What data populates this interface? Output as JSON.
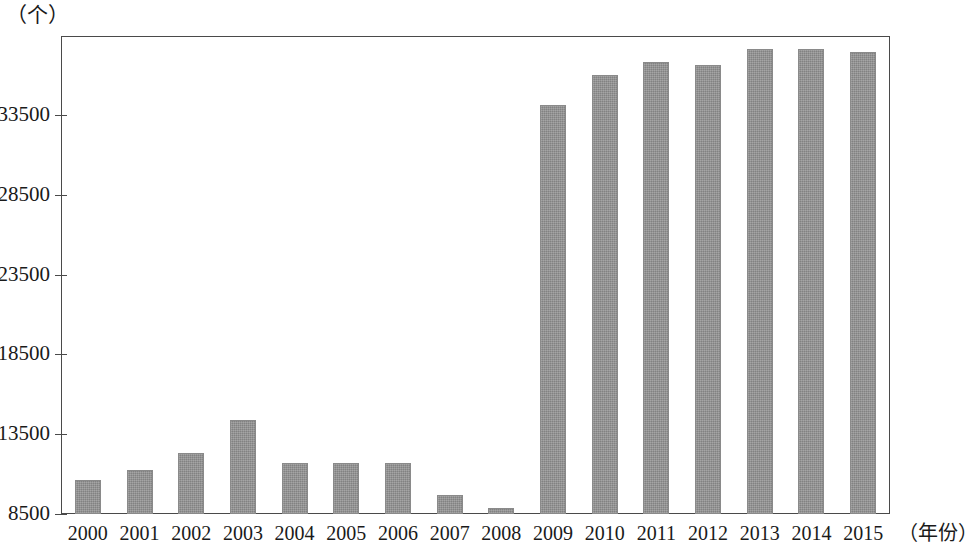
{
  "chart_data": {
    "type": "bar",
    "title": "",
    "subtitle": "",
    "xlabel": "（年份）",
    "ylabel": "（个）",
    "grid": false,
    "legend": null,
    "ylim": [
      8500,
      38375
    ],
    "yticks": [
      8500,
      13500,
      18500,
      23500,
      28500,
      33500
    ],
    "ytick_labels": [
      "8500",
      "13500",
      "18500",
      "23500",
      "28500",
      "33500"
    ],
    "categories": [
      "2000",
      "2001",
      "2002",
      "2003",
      "2004",
      "2005",
      "2006",
      "2007",
      "2008",
      "2009",
      "2010",
      "2011",
      "2012",
      "2013",
      "2014",
      "2015"
    ],
    "values": [
      10600,
      11250,
      12350,
      14400,
      11700,
      11700,
      11700,
      9700,
      8850,
      34100,
      36000,
      36800,
      36600,
      37600,
      37600,
      37450
    ],
    "bar_color": "#909090",
    "axis_color": "#4a4a4a",
    "background": "#ffffff"
  },
  "axes": {
    "y_unit_label": "（个）",
    "x_unit_label": "（年份）"
  }
}
